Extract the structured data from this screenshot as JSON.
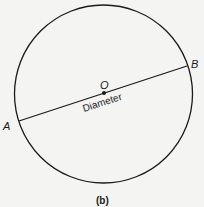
{
  "figure": {
    "caption": "(b)",
    "center_label": "O",
    "point_a_label": "A",
    "point_b_label": "B",
    "line_label": "Diameter"
  },
  "colors": {
    "background": "#f4f4f2",
    "stroke": "#1a1a1a"
  }
}
